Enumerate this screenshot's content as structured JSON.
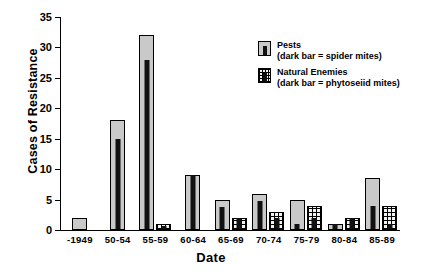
{
  "chart_data": {
    "type": "bar",
    "title": "",
    "xlabel": "Date",
    "ylabel": "Cases of Resistance",
    "ylim": [
      0,
      35
    ],
    "yticks": [
      0,
      5,
      10,
      15,
      20,
      25,
      30,
      35
    ],
    "grid": false,
    "legend_position": "upper right",
    "categories": [
      "-1949",
      "50-54",
      "55-59",
      "60-64",
      "65-69",
      "70-74",
      "75-79",
      "80-84",
      "85-89"
    ],
    "series": [
      {
        "name": "Pests",
        "sublabel": "(dark bar = spider mites)",
        "key": "pests",
        "outer_values": [
          2,
          18,
          32,
          9,
          5,
          6,
          5,
          1,
          8.5
        ],
        "inner_values": [
          0,
          15,
          28,
          9,
          3.7,
          4.7,
          1,
          1,
          4
        ]
      },
      {
        "name": "Natural Enemies",
        "sublabel": "(dark bar = phytoseiid mites)",
        "key": "enemies",
        "outer_values": [
          null,
          null,
          1,
          null,
          2,
          3,
          4,
          2,
          4
        ],
        "inner_values": [
          null,
          null,
          0.7,
          null,
          2,
          2,
          2,
          2,
          1
        ]
      }
    ],
    "colors": {
      "pests_fill": "#c9c9c9",
      "enemies_fill": "#f2f2f2",
      "inner_fill": "#111111",
      "outline": "#000000"
    }
  },
  "legend": {
    "items": [
      {
        "label": "Pests",
        "sublabel": "(dark bar = spider mites)"
      },
      {
        "label": "Natural Enemies",
        "sublabel": "(dark bar = phytoseiid mites)"
      }
    ]
  }
}
